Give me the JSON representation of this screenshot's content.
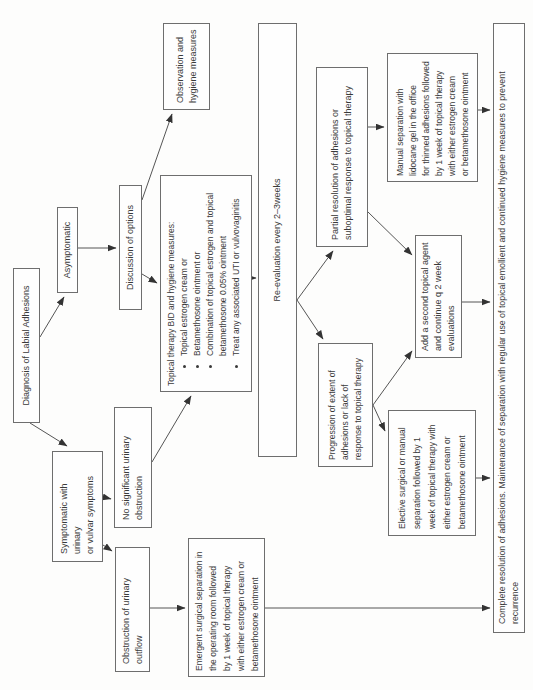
{
  "nodes": {
    "diagnosis": {
      "label": "Diagnosis of Labial Adhesions"
    },
    "asymptomatic": {
      "label": "Asymptomatic"
    },
    "symptomatic": {
      "label": "Symptomatic with urinary\nor vulvar symptoms"
    },
    "discussion": {
      "label": "Discussion of options"
    },
    "observation": {
      "label": "Observation and\nhygiene measures"
    },
    "no_sig": {
      "label": "No significant urinary\nobstruction"
    },
    "obstruction": {
      "label": "Obstruction of urinary\noutflow"
    },
    "topical": {
      "title": "Topical therapy BID and hygiene measures:",
      "bullets": [
        "Topical estrogen cream or",
        "Betamethosone ointment or",
        "Combination of topical estrogen and topical betamethosone 0.05% ointment",
        "Treat any associated UTI or vulvovaginitis"
      ]
    },
    "reeval": {
      "label": "Re-evaluation every 2–3weeks"
    },
    "partial": {
      "label": "Partial resolution of adhesions or\nsuboptimal response to topical therapy"
    },
    "progression": {
      "label": "Progression of extent of\nadhesions or lack of\nresponse to topical therapy"
    },
    "manual": {
      "label": "Manual separation with\nlidocane gel in the office\nfor thinned adhesions followed\nby 1 week of topical therapy\nwith either estrogen cream\nor betamethosone ointment"
    },
    "add_second": {
      "label": "Add a second topical agent\nand continue q 2 week\nevaluations"
    },
    "elective": {
      "label": "Elective surgical or manual\nseparation followed by 1\nweek of topical therapy with\neither estrogen cream or\nbetamethosone ointment"
    },
    "emergent": {
      "label": "Emergent surgical separation in\nthe operating room followed\nby 1 week of topical therapy\nwith either estrogen cream or\nbetamethosone ointment"
    },
    "complete": {
      "label": "Complete resolution of adhesions.  Maintenance of separation with regular use of topical emollient and continued hygiene measures to prevent recurrence"
    }
  },
  "edges": [
    {
      "from": "diagnosis",
      "to": "asymptomatic"
    },
    {
      "from": "diagnosis",
      "to": "symptomatic"
    },
    {
      "from": "asymptomatic",
      "to": "discussion"
    },
    {
      "from": "discussion",
      "to": "observation"
    },
    {
      "from": "discussion",
      "to": "topical"
    },
    {
      "from": "symptomatic",
      "to": "no_sig"
    },
    {
      "from": "symptomatic",
      "to": "obstruction"
    },
    {
      "from": "no_sig",
      "to": "topical"
    },
    {
      "from": "obstruction",
      "to": "emergent"
    },
    {
      "from": "topical",
      "to": "reeval"
    },
    {
      "from": "reeval",
      "to": "partial"
    },
    {
      "from": "reeval",
      "to": "progression"
    },
    {
      "from": "partial",
      "to": "manual"
    },
    {
      "from": "partial",
      "to": "add_second"
    },
    {
      "from": "progression",
      "to": "add_second"
    },
    {
      "from": "progression",
      "to": "elective"
    },
    {
      "from": "manual",
      "to": "complete"
    },
    {
      "from": "add_second",
      "to": "complete"
    },
    {
      "from": "elective",
      "to": "complete"
    },
    {
      "from": "emergent",
      "to": "complete"
    }
  ],
  "colors": {
    "border": "#6e6e6e",
    "text": "#3a3a3a",
    "arrow": "#444444",
    "background": "#fdfdfc"
  }
}
